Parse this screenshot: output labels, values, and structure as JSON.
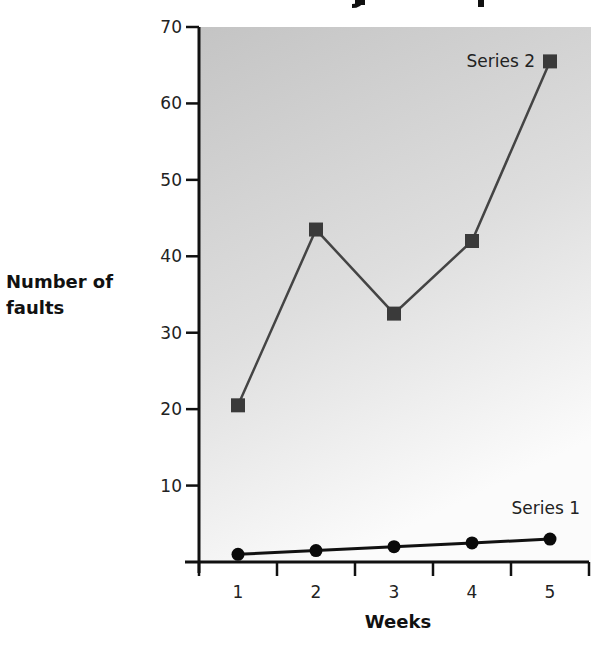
{
  "chart_data": {
    "type": "line",
    "title": "",
    "xlabel": "Weeks",
    "ylabel": "Number of faults",
    "ylabel_lines": [
      "Number of",
      "faults"
    ],
    "categories": [
      "1",
      "2",
      "3",
      "4",
      "5"
    ],
    "x": [
      1,
      2,
      3,
      4,
      5
    ],
    "yticks": [
      10,
      20,
      30,
      40,
      50,
      60,
      70
    ],
    "ylim": [
      0,
      70
    ],
    "grid": false,
    "legend": "inline labels",
    "series": [
      {
        "name": "Series 1",
        "marker": "circle",
        "color": "#111111",
        "values": [
          1,
          1.5,
          2,
          2.5,
          3
        ]
      },
      {
        "name": "Series 2",
        "marker": "square",
        "color": "#3a3a3a",
        "values": [
          20.5,
          43.5,
          32.5,
          42,
          65.5
        ]
      }
    ],
    "background": {
      "gradient_top": "#c4c4c4",
      "gradient_bottom": "#fbfbfb"
    }
  }
}
